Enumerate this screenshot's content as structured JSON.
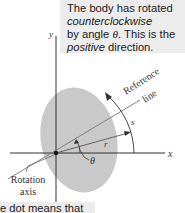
{
  "callout_top": {
    "line1": "The body has rotated",
    "line2": "counterclockwise",
    "line3_pre": "by angle ",
    "line3_symbol": "θ",
    "line3_post": ". This is the",
    "line4_italic": "positive",
    "line4_post": " direction."
  },
  "callout_bottom": {
    "text": "e dot means that"
  },
  "diagram": {
    "y_axis_label": "y",
    "x_axis_label": "x",
    "reference_line_label_1": "Reference",
    "reference_line_label_2": "line",
    "arc_label": "s",
    "radius_label": "r",
    "angle_label": "θ",
    "rotation_axis_label_1": "Rotation",
    "rotation_axis_label_2": "axis",
    "colors": {
      "body_fill": "#c9c9c9",
      "line": "#333333",
      "callout_bg": "#ececec"
    }
  }
}
